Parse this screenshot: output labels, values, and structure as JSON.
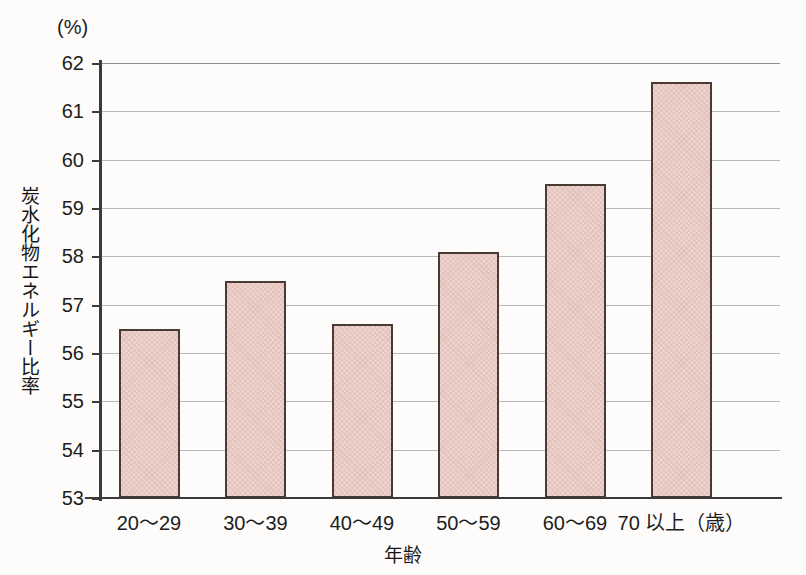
{
  "chart_data": {
    "type": "bar",
    "title": "",
    "subtitle": "",
    "xlabel": "年齢",
    "ylabel": "炭水化物エネルギー比率",
    "unit_label": "(%)",
    "categories": [
      "20～29",
      "30～39",
      "40～49",
      "50～59",
      "60～69",
      "70 以上（歳）"
    ],
    "values": [
      56.5,
      57.5,
      56.6,
      58.1,
      59.5,
      61.6
    ],
    "series": [
      {
        "name": "炭水化物エネルギー比率",
        "values": [
          56.5,
          57.5,
          56.6,
          58.1,
          59.5,
          61.6
        ]
      }
    ],
    "ylim": [
      53,
      62
    ],
    "xlim_note": "categorical",
    "yticks": [
      53,
      54,
      55,
      56,
      57,
      58,
      59,
      60,
      61,
      62
    ],
    "ytick_labels": [
      "53",
      "54",
      "55",
      "56",
      "57",
      "58",
      "59",
      "60",
      "61",
      "62"
    ],
    "grid": true,
    "grid_axis": "y",
    "legend": false,
    "legend_position": "none",
    "bar_fill_color": "#eed6d0",
    "bar_edge_color": "#4a3a36",
    "gridline_color": "#b9b9b9",
    "axis_color": "#3a3a3a",
    "background_color": "#fdfcfa"
  }
}
